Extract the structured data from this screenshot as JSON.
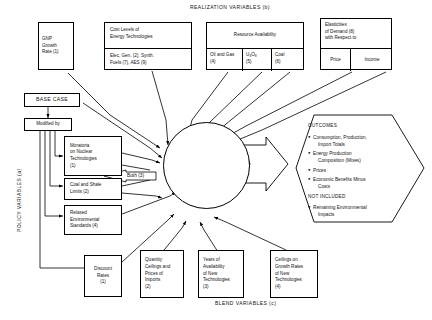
{
  "diagram": {
    "top_title": "REALIZATION VARIABLES (b)",
    "left_title": "POLICY VARIABLES (a)",
    "bottom_title": "BLEND VARIABLES (c)"
  },
  "realization": {
    "gnp": {
      "l1": "GNP",
      "l2": "Growth",
      "l3": "Rate (1)"
    },
    "cost_levels": {
      "header_l1": "Cost Levels of",
      "header_l2": "Energy Technologies",
      "body_l1": "Elec. Gen. (2), Synth.",
      "body_l2": "Fuels (7), AES (9)"
    },
    "resource": {
      "header": "Resource Availability",
      "cells": [
        {
          "l1": "Oil and Gas",
          "l2": "(4)"
        },
        {
          "l1": "U3O8",
          "l2": "(5)"
        },
        {
          "l1": "Coal",
          "l2": "(6)"
        }
      ]
    },
    "elasticities": {
      "header_l1": "Elasticities",
      "header_l2": "of Demand (8)",
      "header_l3": "with Respect to",
      "cells": [
        {
          "label": "Price"
        },
        {
          "label": "Income"
        }
      ]
    }
  },
  "policy": {
    "base_case": "BASE CASE",
    "modified_by": "Modified by",
    "boxes": [
      {
        "l1": "Moratoria",
        "l2": "on Nuclear",
        "l3": "Technologies",
        "l4": "(1)"
      },
      {
        "l1": "Coal and Shale",
        "l2": "Limits (2)"
      },
      {
        "l1": "Relaxed",
        "l2": "Environmental",
        "l3": "Standards (4)"
      }
    ],
    "both_label": "Both (3)"
  },
  "models": {
    "title": "ENERGY MODELS",
    "items": [
      "(1) DRI",
      "(2) DESOM",
      "(3) SRI",
      "(4) PIES",
      "(5) ETA",
      "(6) Nordhaus"
    ]
  },
  "outcomes": {
    "title": "OUTCOMES",
    "bullets": [
      {
        "l1": "Consumption, Production,",
        "l2": "Import Totals"
      },
      {
        "l1": "Energy Production",
        "l2": "Composition (Mixes)"
      },
      {
        "l1": "Prices",
        "l2": ""
      },
      {
        "l1": "Economic Benefits Minus",
        "l2": "Costs"
      }
    ],
    "not_included_title": "NOT INCLUDED",
    "not_included": [
      {
        "l1": "Remaining Environmental",
        "l2": "Impacts"
      }
    ]
  },
  "blend": {
    "boxes": [
      {
        "l1": "Discount",
        "l2": "Rates",
        "l3": "(1)"
      },
      {
        "l1": "Quantity",
        "l2": "Ceilings and",
        "l3": "Prices of",
        "l4": "Imports",
        "l5": "(2)"
      },
      {
        "l1": "Years of",
        "l2": "Availability",
        "l3": "of New",
        "l4": "Technologies",
        "l5": "(3)"
      },
      {
        "l1": "Ceilings on",
        "l2": "Growth Rates",
        "l3": "of New",
        "l4": "Technologies",
        "l5": "(4)"
      }
    ]
  },
  "colors": {
    "ink": "#111111",
    "line": "#000000",
    "paper": "#ffffff"
  }
}
